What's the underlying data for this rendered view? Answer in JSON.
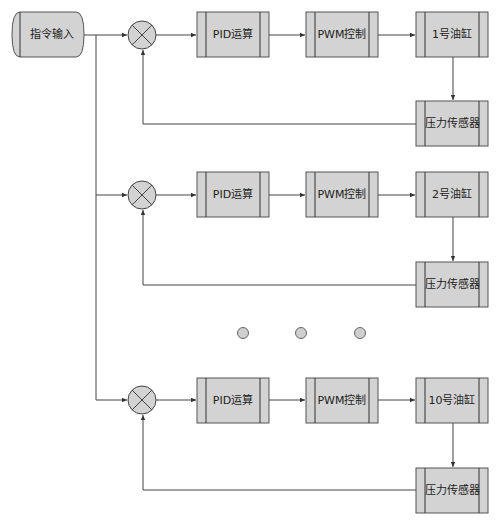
{
  "diagram": {
    "title": "",
    "input": {
      "label": "指令输入"
    },
    "channels": [
      {
        "pid": "PID运算",
        "pwm": "PWM控制",
        "cylinder": "1号油缸",
        "sensor": "压力传感器"
      },
      {
        "pid": "PID运算",
        "pwm": "PWM控制",
        "cylinder": "2号油缸",
        "sensor": "压力传感器"
      },
      {
        "pid": "PID运算",
        "pwm": "PWM控制",
        "cylinder": "10号油缸",
        "sensor": "压力传感器"
      }
    ],
    "ellipsis": {
      "count": 3,
      "meaning": "channels 3 to 9 omitted"
    },
    "colors": {
      "block_fill": "#d3d3d3",
      "line": "#444444",
      "background": "#ffffff"
    }
  }
}
